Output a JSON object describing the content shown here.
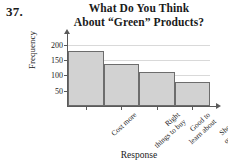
{
  "problem_number": "37.",
  "title": {
    "line1": "What Do You Think",
    "line2": "About “Green” Products?"
  },
  "axis": {
    "ylabel": "Frequency",
    "xlabel": "Response"
  },
  "colors": {
    "bar_fill": "#d2d2d2",
    "bar_border": "#6d6d6d",
    "axis": "#5a5a5a",
    "grid": "#d9d9d9",
    "text": "#1a1a1a"
  },
  "chart_data": {
    "type": "bar",
    "title": "What Do You Think About “Green” Products?",
    "xlabel": "Response",
    "ylabel": "Frequency",
    "categories": [
      "Cost more",
      "Right things to buy",
      "Good to learn about",
      "Should be questioned"
    ],
    "category_lines": [
      [
        "Cost more",
        ""
      ],
      [
        "Right",
        "things to buy"
      ],
      [
        "Good to",
        "learn about"
      ],
      [
        "Should be",
        "questioned"
      ]
    ],
    "values": [
      178,
      138,
      110,
      78
    ],
    "ylim": [
      0,
      215
    ],
    "yticks": [
      50,
      100,
      150,
      200
    ],
    "ytick_labels": [
      "50",
      "100",
      "150",
      "200"
    ],
    "grid": true,
    "legend": false
  }
}
